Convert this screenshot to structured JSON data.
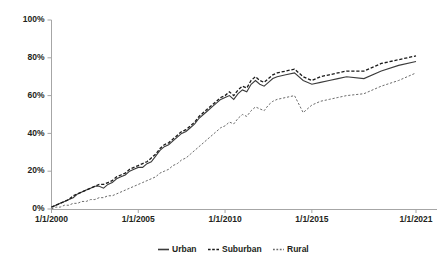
{
  "chart_data": {
    "type": "line",
    "title": "",
    "subtitle": "",
    "xlabel": "",
    "ylabel": "",
    "grid": false,
    "legend_position": "bottom",
    "xlim": [
      "1/1/2000",
      "1/1/2021"
    ],
    "ylim": [
      0,
      100
    ],
    "yticks": [
      0,
      20,
      40,
      60,
      80,
      100
    ],
    "ytick_labels": [
      "0%",
      "20%",
      "40%",
      "60%",
      "80%",
      "100%"
    ],
    "xtick_labels": [
      "1/1/2000",
      "1/1/2005",
      "1/1/2010",
      "1/1/2015",
      "1/1/2021"
    ],
    "xtick_values": [
      2000,
      2005,
      2010,
      2015,
      2021
    ],
    "legend": [
      "Urban",
      "Suburban",
      "Rural"
    ],
    "x": [
      2000.0,
      2000.25,
      2000.5,
      2000.75,
      2001.0,
      2001.25,
      2001.5,
      2001.75,
      2002.0,
      2002.25,
      2002.5,
      2002.75,
      2003.0,
      2003.25,
      2003.5,
      2003.75,
      2004.0,
      2004.25,
      2004.5,
      2004.75,
      2005.0,
      2005.25,
      2005.5,
      2005.75,
      2006.0,
      2006.25,
      2006.5,
      2006.75,
      2007.0,
      2007.25,
      2007.5,
      2007.75,
      2008.0,
      2008.25,
      2008.5,
      2008.75,
      2009.0,
      2009.25,
      2009.5,
      2009.75,
      2010.0,
      2010.25,
      2010.5,
      2010.75,
      2011.0,
      2011.25,
      2011.5,
      2011.75,
      2012.0,
      2012.25,
      2012.5,
      2012.75,
      2013.0,
      2013.5,
      2014.0,
      2014.5,
      2015.0,
      2015.5,
      2016.0,
      2016.5,
      2017.0,
      2018.0,
      2019.0,
      2020.0,
      2021.0
    ],
    "series": [
      {
        "name": "Urban",
        "style": "solid",
        "values": [
          1,
          2,
          3,
          4,
          5,
          6,
          8,
          9,
          10,
          11,
          12,
          12,
          11,
          13,
          14,
          16,
          17,
          18,
          20,
          21,
          22,
          22,
          24,
          25,
          28,
          31,
          33,
          34,
          36,
          38,
          40,
          41,
          43,
          45,
          48,
          50,
          52,
          54,
          56,
          58,
          59,
          60,
          58,
          61,
          63,
          62,
          66,
          68,
          66,
          65,
          67,
          69,
          70,
          71,
          72,
          68,
          66,
          67,
          68,
          69,
          70,
          69,
          73,
          76,
          78
        ]
      },
      {
        "name": "Suburban",
        "style": "dashed",
        "values": [
          1,
          2,
          3,
          4,
          5,
          7,
          8,
          9,
          10,
          11,
          12,
          13,
          13,
          14,
          15,
          17,
          18,
          19,
          21,
          22,
          23,
          24,
          25,
          27,
          29,
          32,
          34,
          35,
          37,
          39,
          41,
          42,
          44,
          46,
          49,
          51,
          53,
          55,
          57,
          59,
          60,
          62,
          60,
          63,
          65,
          64,
          68,
          70,
          68,
          67,
          69,
          71,
          72,
          73,
          74,
          70,
          68,
          70,
          71,
          72,
          73,
          73,
          77,
          79,
          81
        ]
      },
      {
        "name": "Rural",
        "style": "dotted",
        "values": [
          0,
          1,
          1,
          2,
          2,
          3,
          3,
          4,
          4,
          5,
          5,
          6,
          6,
          7,
          7,
          8,
          9,
          10,
          11,
          12,
          13,
          14,
          15,
          16,
          17,
          19,
          20,
          21,
          23,
          24,
          26,
          27,
          29,
          31,
          33,
          35,
          37,
          39,
          41,
          43,
          44,
          46,
          45,
          48,
          50,
          49,
          52,
          54,
          53,
          52,
          55,
          57,
          58,
          59,
          60,
          51,
          55,
          57,
          58,
          59,
          60,
          61,
          65,
          68,
          72
        ]
      }
    ]
  },
  "legend": {
    "items": [
      {
        "label": "Urban",
        "marker": "solid-line-marker"
      },
      {
        "label": "Suburban",
        "marker": "dashed-line-marker"
      },
      {
        "label": "Rural",
        "marker": "dotted-line-marker"
      }
    ]
  }
}
